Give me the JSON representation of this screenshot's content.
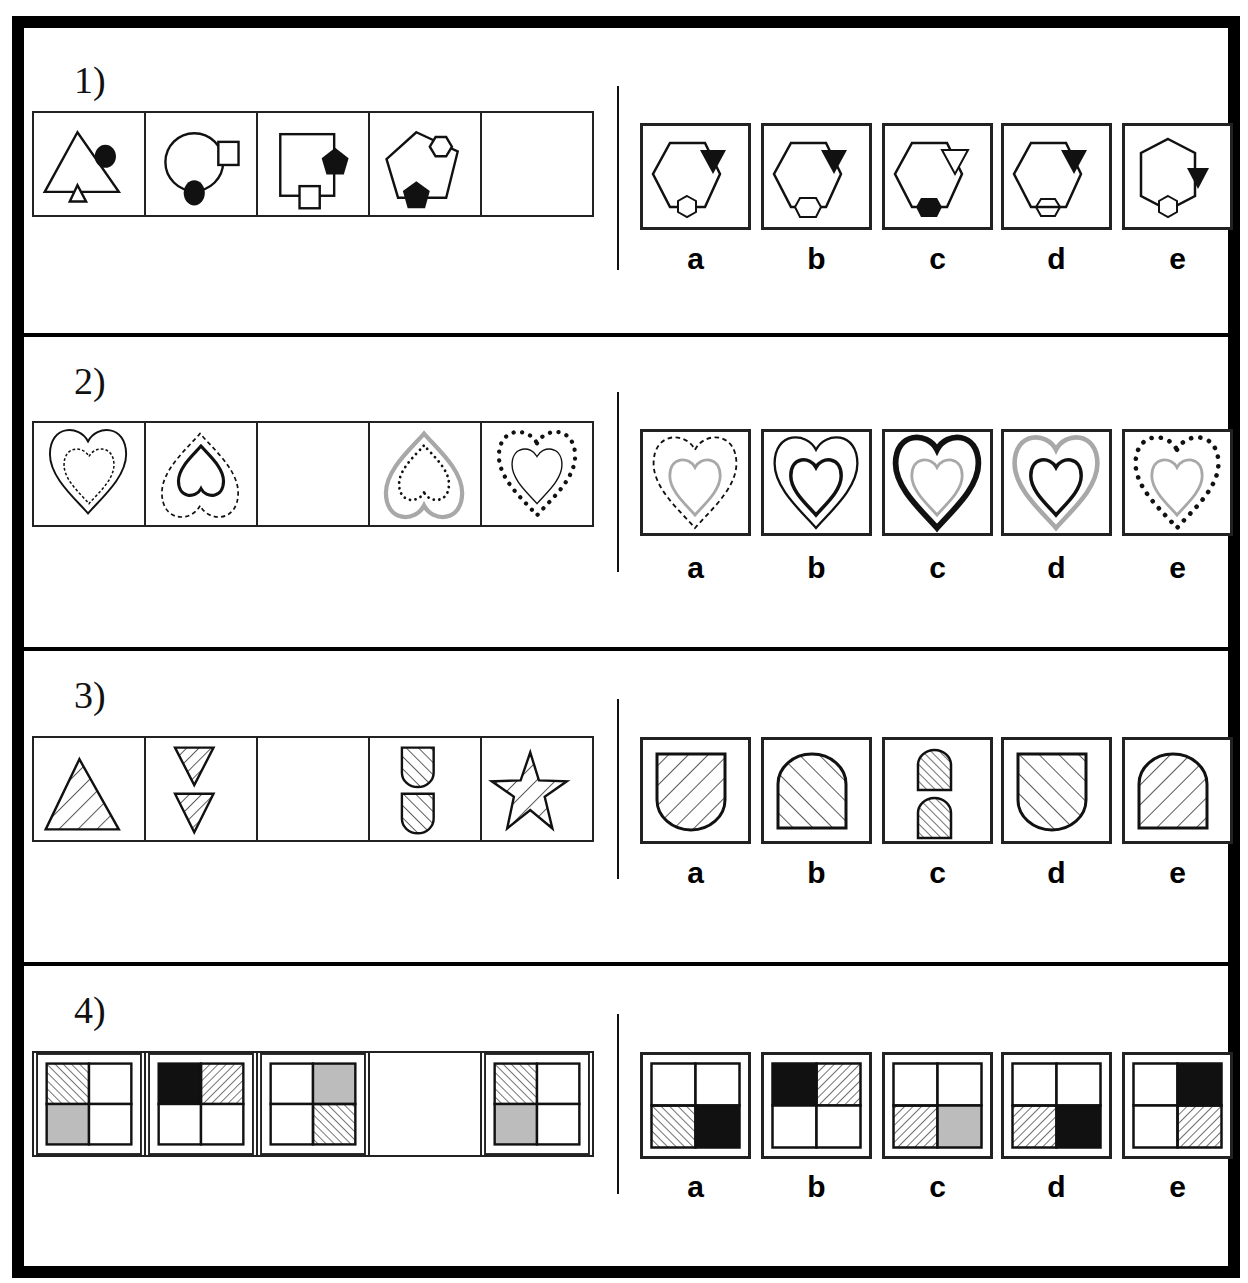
{
  "questions": [
    {
      "number": "1)",
      "sequence": [
        {
          "description": "outline triangle with black circle at upper right and small outline triangle at bottom"
        },
        {
          "description": "outline circle with small outline square at upper right and black circle at bottom"
        },
        {
          "description": "outline square with black pentagon at right and small outline square at bottom"
        },
        {
          "description": "outline pentagon with small outline hexagon at upper right and black pentagon at bottom"
        },
        {
          "description": "empty (answer cell)"
        }
      ],
      "options": [
        {
          "label": "a",
          "description": "hexagon, black triangle upper right, outline hexagon at bottom"
        },
        {
          "label": "b",
          "description": "hexagon, black triangle upper right, outline hexagon at bottom (raised)"
        },
        {
          "label": "c",
          "description": "hexagon, outline triangle upper right, black hexagon at bottom"
        },
        {
          "label": "d",
          "description": "hexagon, black triangle upper right, overlapping outline hexagon at bottom"
        },
        {
          "label": "e",
          "description": "pointy-top hexagon, black triangle at right, outline hexagon at bottom"
        }
      ]
    },
    {
      "number": "2)",
      "sequence": [
        {
          "description": "thin solid outer heart, dashed inner heart"
        },
        {
          "description": "dashed outer inverted heart, thick black inner inverted heart"
        },
        {
          "description": "empty (answer cell)"
        },
        {
          "description": "grey outer inverted heart, dotted inner inverted heart"
        },
        {
          "description": "dotted outer heart, thin solid inner heart"
        }
      ],
      "options": [
        {
          "label": "a",
          "description": "dashed outer heart, grey inner heart"
        },
        {
          "label": "b",
          "description": "thin outer heart, thick black inner heart"
        },
        {
          "label": "c",
          "description": "thick black outer heart, grey inner heart"
        },
        {
          "label": "d",
          "description": "grey outer heart, thick black inner heart"
        },
        {
          "label": "e",
          "description": "dotted outer heart, grey inner heart"
        }
      ]
    },
    {
      "number": "3)",
      "sequence": [
        {
          "description": "hatched triangle (\\ diagonal)"
        },
        {
          "description": "two small inverted hatched triangles"
        },
        {
          "description": "empty (answer cell)"
        },
        {
          "description": "two small hatched shield shapes (/ diagonal)"
        },
        {
          "description": "hatched star (\\ diagonal)"
        }
      ],
      "options": [
        {
          "label": "a",
          "description": "large shield, rounded bottom, \\ hatch"
        },
        {
          "label": "b",
          "description": "large arch, rounded top, / hatch"
        },
        {
          "label": "c",
          "description": "two small arches, / hatch"
        },
        {
          "label": "d",
          "description": "large shield, rounded bottom, / hatch"
        },
        {
          "label": "e",
          "description": "large arch, rounded top, \\ hatch"
        }
      ]
    },
    {
      "number": "4)",
      "sequence": [
        {
          "grid": [
            "hatch-fwd",
            "white",
            "grey",
            "white"
          ]
        },
        {
          "grid": [
            "black",
            "hatch-back",
            "white",
            "white"
          ]
        },
        {
          "grid": [
            "white",
            "grey",
            "white",
            "hatch-fwd"
          ]
        },
        {
          "grid": null
        },
        {
          "grid": [
            "hatch-fwd",
            "white",
            "grey",
            "white"
          ]
        }
      ],
      "options": [
        {
          "label": "a",
          "grid": [
            "white",
            "white",
            "hatch-fwd",
            "black"
          ]
        },
        {
          "label": "b",
          "grid": [
            "black",
            "hatch-back",
            "white",
            "white"
          ]
        },
        {
          "label": "c",
          "grid": [
            "white",
            "white",
            "hatch-back",
            "grey"
          ]
        },
        {
          "label": "d",
          "grid": [
            "white",
            "white",
            "hatch-back",
            "black"
          ]
        },
        {
          "label": "e",
          "grid": [
            "white",
            "black",
            "white",
            "hatch-back"
          ]
        }
      ]
    }
  ],
  "colors": {
    "line": "#111111",
    "grey": "#a8a8a8",
    "fill_grey": "#bcbcbc"
  }
}
